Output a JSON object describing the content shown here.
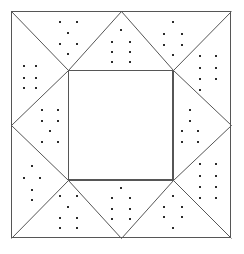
{
  "figure": {
    "canvas": {
      "width": 244,
      "height": 254
    },
    "colors": {
      "background": "#ffffff",
      "line": "#565656",
      "dot": "#2b2b2b",
      "fill": "#ffffff"
    },
    "line_width": 1,
    "dot_size": 2.2
  },
  "geometry": {
    "outer_square": {
      "left": 11,
      "top": 11,
      "right": 231,
      "bottom": 238
    },
    "inner_square": {
      "left": 68,
      "top": 70,
      "right": 173,
      "bottom": 180
    },
    "edge_midpoints": {
      "top_x": 121,
      "bottom_x": 121,
      "left_y": 125,
      "right_y": 125
    },
    "corner_diagonals": [
      {
        "name": "top-left",
        "from": [
          11,
          11
        ],
        "to": [
          68,
          70
        ]
      },
      {
        "name": "top-right",
        "from": [
          231,
          11
        ],
        "to": [
          173,
          70
        ]
      },
      {
        "name": "bottom-right",
        "from": [
          231,
          238
        ],
        "to": [
          173,
          180
        ]
      },
      {
        "name": "bottom-left",
        "from": [
          11,
          238
        ],
        "to": [
          68,
          180
        ]
      }
    ],
    "edge_triangles": [
      {
        "name": "top",
        "apex": [
          121,
          11
        ],
        "base": [
          [
            68,
            70
          ],
          [
            173,
            70
          ]
        ]
      },
      {
        "name": "right",
        "apex": [
          231,
          125
        ],
        "base": [
          [
            173,
            70
          ],
          [
            173,
            180
          ]
        ]
      },
      {
        "name": "bottom",
        "apex": [
          121,
          238
        ],
        "base": [
          [
            68,
            180
          ],
          [
            173,
            180
          ]
        ]
      },
      {
        "name": "left",
        "apex": [
          11,
          125
        ],
        "base": [
          [
            68,
            70
          ],
          [
            68,
            180
          ]
        ]
      }
    ]
  },
  "stipple": {
    "regions": [
      {
        "name": "top-left-upper",
        "dots": [
          [
            60,
            22
          ],
          [
            77,
            22
          ],
          [
            68,
            33
          ],
          [
            60,
            44
          ],
          [
            77,
            44
          ],
          [
            68,
            54
          ]
        ]
      },
      {
        "name": "top-triangle",
        "dots": [
          [
            121,
            30
          ],
          [
            112,
            42
          ],
          [
            130,
            42
          ],
          [
            112,
            52
          ],
          [
            130,
            52
          ],
          [
            112,
            62
          ],
          [
            130,
            62
          ]
        ]
      },
      {
        "name": "top-right-upper",
        "dots": [
          [
            173,
            22
          ],
          [
            164,
            34
          ],
          [
            182,
            34
          ],
          [
            164,
            45
          ],
          [
            182,
            45
          ],
          [
            173,
            55
          ]
        ]
      },
      {
        "name": "top-left-corner",
        "dots": [
          [
            24,
            66
          ],
          [
            36,
            66
          ],
          [
            24,
            78
          ],
          [
            36,
            78
          ],
          [
            24,
            88
          ],
          [
            36,
            88
          ]
        ]
      },
      {
        "name": "top-right-corner",
        "dots": [
          [
            200,
            56
          ],
          [
            216,
            56
          ],
          [
            200,
            68
          ],
          [
            216,
            68
          ],
          [
            200,
            79
          ],
          [
            216,
            79
          ],
          [
            200,
            90
          ]
        ]
      },
      {
        "name": "left-triangle",
        "dots": [
          [
            42,
            110
          ],
          [
            58,
            110
          ],
          [
            42,
            121
          ],
          [
            58,
            121
          ],
          [
            50,
            131
          ],
          [
            42,
            142
          ],
          [
            58,
            142
          ]
        ]
      },
      {
        "name": "right-triangle",
        "dots": [
          [
            190,
            110
          ],
          [
            190,
            121
          ],
          [
            182,
            131
          ],
          [
            198,
            131
          ],
          [
            182,
            142
          ],
          [
            198,
            142
          ]
        ]
      },
      {
        "name": "bottom-left-corner",
        "dots": [
          [
            32,
            166
          ],
          [
            24,
            178
          ],
          [
            40,
            178
          ],
          [
            32,
            190
          ],
          [
            32,
            200
          ]
        ]
      },
      {
        "name": "bottom-right-corner",
        "dots": [
          [
            200,
            164
          ],
          [
            216,
            164
          ],
          [
            200,
            176
          ],
          [
            216,
            176
          ],
          [
            200,
            187
          ],
          [
            216,
            187
          ],
          [
            200,
            198
          ],
          [
            216,
            198
          ]
        ]
      },
      {
        "name": "bottom-left-lower",
        "dots": [
          [
            60,
            196
          ],
          [
            77,
            196
          ],
          [
            68,
            207
          ],
          [
            60,
            218
          ],
          [
            77,
            218
          ],
          [
            60,
            228
          ],
          [
            77,
            228
          ]
        ]
      },
      {
        "name": "bottom-triangle",
        "dots": [
          [
            121,
            188
          ],
          [
            112,
            198
          ],
          [
            130,
            198
          ],
          [
            112,
            209
          ],
          [
            130,
            209
          ],
          [
            112,
            219
          ],
          [
            130,
            219
          ]
        ]
      },
      {
        "name": "bottom-right-lower",
        "dots": [
          [
            173,
            196
          ],
          [
            164,
            207
          ],
          [
            182,
            207
          ],
          [
            164,
            217
          ],
          [
            182,
            217
          ],
          [
            173,
            228
          ]
        ]
      }
    ]
  }
}
